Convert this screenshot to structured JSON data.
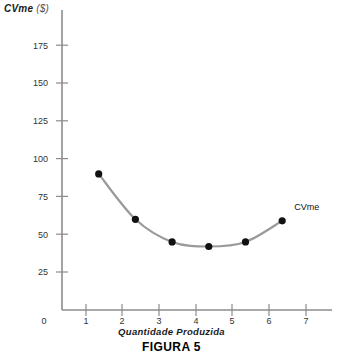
{
  "chart_data": {
    "type": "line",
    "title": "",
    "caption": "FIGURA 5",
    "xlabel": "Quantidade  Produzida",
    "ylabel": "CVme ($)",
    "ylabel_main": "CVme",
    "ylabel_unit": "($)",
    "series_label": "CVme",
    "x": [
      1,
      2,
      3,
      4,
      5,
      6
    ],
    "values": [
      90,
      60,
      45,
      42,
      45,
      59
    ],
    "series": [
      {
        "name": "CVme",
        "x": [
          1,
          2,
          3,
          4,
          5,
          6
        ],
        "values": [
          90,
          60,
          45,
          42,
          45,
          59
        ]
      }
    ],
    "xlim": [
      0,
      7.5
    ],
    "ylim": [
      0,
      190
    ],
    "xticks": [
      0,
      1,
      2,
      3,
      4,
      5,
      6,
      7
    ],
    "xticklabels": [
      "0",
      "1",
      "2",
      "3",
      "4",
      "5",
      "6",
      "7"
    ],
    "yticks": [
      25,
      50,
      75,
      100,
      125,
      150,
      175
    ],
    "yticklabels": [
      "25",
      "50",
      "75",
      "100",
      "125",
      "150",
      "175"
    ],
    "grid": false,
    "legend": "none",
    "marker": "circle",
    "colors": {
      "line": "#9a9a9a",
      "marker": "#111111",
      "axis": "#8c8c8c",
      "text": "#1a1a1a"
    }
  },
  "axis": {
    "origin_label": "0"
  }
}
